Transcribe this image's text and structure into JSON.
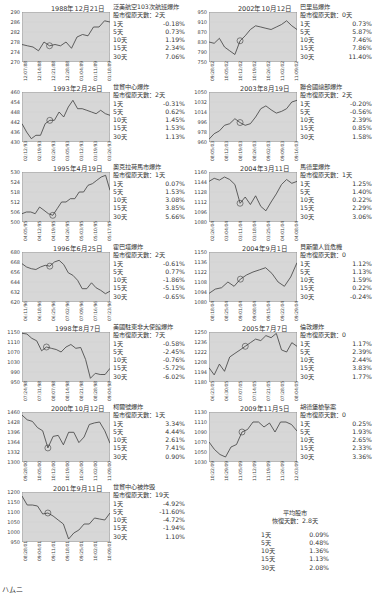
{
  "chart_data": [
    {
      "type": "line",
      "title": "1988年12月21日",
      "event": "泛美航空103次航班爆炸",
      "recovery": "股市復原天數：2天",
      "ylim": [
        270,
        290
      ],
      "yticks": [
        270,
        274,
        278,
        282,
        286,
        290
      ],
      "x": [
        "12/07/88",
        "12/14/88",
        "12/21/88",
        "12/28/88",
        "01/04/89",
        "01/11/89",
        "01/18/89"
      ],
      "values": [
        277,
        276.5,
        276,
        274.5,
        278,
        276.5,
        277,
        276.5,
        278,
        275.5,
        280,
        281,
        280.5,
        284,
        284,
        286.5,
        286
      ],
      "marker_index": 5,
      "returns": [
        {
          "p": "1天",
          "v": "-0.18%"
        },
        {
          "p": "5天",
          "v": "0.73%"
        },
        {
          "p": "10天",
          "v": "1.19%"
        },
        {
          "p": "15天",
          "v": "2.34%"
        },
        {
          "p": "30天",
          "v": "7.06%"
        }
      ]
    },
    {
      "type": "line",
      "title": "1993年2月26日",
      "event": "世貿中心爆炸",
      "recovery": "股市復原天數：2天",
      "ylim": [
        430,
        460
      ],
      "yticks": [
        430,
        436,
        442,
        448,
        454,
        460
      ],
      "x": [
        "02/12/93",
        "02/19/93",
        "02/26/93",
        "03/05/93",
        "03/12/93",
        "03/19/93",
        "03/26/93"
      ],
      "values": [
        441,
        436,
        432,
        434,
        434,
        441,
        443,
        443,
        448,
        445,
        451,
        455,
        450,
        450,
        449,
        448,
        447,
        449,
        447,
        446
      ],
      "marker_index": 6,
      "returns": [
        {
          "p": "1天",
          "v": "-0.31%"
        },
        {
          "p": "5天",
          "v": "0.62%"
        },
        {
          "p": "10天",
          "v": "1.45%"
        },
        {
          "p": "15天",
          "v": "1.53%"
        },
        {
          "p": "30天",
          "v": "1.13%"
        }
      ]
    },
    {
      "type": "line",
      "title": "1995年4月19日",
      "event": "奧克拉荷馬市爆炸",
      "recovery": "股市復原天數：1天",
      "ylim": [
        500,
        530
      ],
      "yticks": [
        500,
        506,
        512,
        518,
        524,
        530
      ],
      "x": [
        "04/05/95",
        "04/12/95",
        "04/19/95",
        "04/26/95",
        "05/03/95",
        "05/10/95",
        "05/17/95"
      ],
      "values": [
        505,
        506,
        506,
        505,
        509,
        507,
        505,
        504,
        508,
        512,
        512,
        514,
        514,
        518,
        518,
        522,
        523,
        525,
        527,
        528,
        519
      ],
      "marker_index": 7,
      "returns": [
        {
          "p": "1天",
          "v": "0.07%"
        },
        {
          "p": "5天",
          "v": "1.53%"
        },
        {
          "p": "10天",
          "v": "3.08%"
        },
        {
          "p": "15天",
          "v": "3.85%"
        },
        {
          "p": "30天",
          "v": "5.66%"
        }
      ]
    },
    {
      "type": "line",
      "title": "1996年6月25日",
      "event": "霍巴塔爆炸",
      "recovery": "股市復原天數：2天",
      "ylim": [
        620,
        680
      ],
      "yticks": [
        620,
        632,
        644,
        656,
        668,
        680
      ],
      "x": [
        "06/11/96",
        "06/18/96",
        "06/25/96",
        "07/02/96",
        "07/09/96",
        "07/16/96",
        "07/23/96"
      ],
      "values": [
        666,
        662,
        660,
        659,
        662,
        664,
        663,
        668,
        670,
        665,
        655,
        652,
        646,
        636,
        636,
        643,
        637,
        634,
        630,
        633
      ],
      "marker_index": 6,
      "returns": [
        {
          "p": "1天",
          "v": "-0.61%"
        },
        {
          "p": "5天",
          "v": "0.77%"
        },
        {
          "p": "10天",
          "v": "-1.86%"
        },
        {
          "p": "15天",
          "v": "-5.15%"
        },
        {
          "p": "30天",
          "v": "-0.65%"
        }
      ]
    },
    {
      "type": "line",
      "title": "1998年8月7日",
      "event": "美國駐東非大使館爆炸",
      "recovery": "股市復原天數：7天",
      "ylim": [
        950,
        1150
      ],
      "yticks": [
        950,
        990,
        1030,
        1070,
        1110,
        1150
      ],
      "x": [
        "07/24/98",
        "07/31/98",
        "08/07/98",
        "08/14/98",
        "08/21/98",
        "08/28/98",
        "09/04/98"
      ],
      "values": [
        1145,
        1142,
        1125,
        1115,
        1075,
        1090,
        1085,
        1080,
        1070,
        1090,
        1100,
        1085,
        1088,
        1040,
        965,
        985,
        980,
        980,
        1005
      ],
      "marker_index": 5,
      "returns": [
        {
          "p": "1天",
          "v": "-0.58%"
        },
        {
          "p": "5天",
          "v": "-2.45%"
        },
        {
          "p": "10天",
          "v": "-0.76%"
        },
        {
          "p": "15天",
          "v": "-5.72%"
        },
        {
          "p": "30天",
          "v": "-6.02%"
        }
      ]
    },
    {
      "type": "line",
      "title": "2000年10月12日",
      "event": "柯爾號爆炸",
      "recovery": "股市復原天數：1天",
      "ylim": [
        1300,
        1460
      ],
      "yticks": [
        1300,
        1332,
        1364,
        1396,
        1428,
        1460
      ],
      "x": [
        "09/28/00",
        "10/05/00",
        "10/12/00",
        "10/19/00",
        "10/26/00",
        "11/02/00",
        "11/09/00"
      ],
      "values": [
        1450,
        1435,
        1430,
        1410,
        1400,
        1345,
        1382,
        1385,
        1355,
        1395,
        1395,
        1362,
        1380,
        1420,
        1425,
        1428,
        1400,
        1360
      ],
      "marker_index": 5,
      "returns": [
        {
          "p": "1天",
          "v": "3.34%"
        },
        {
          "p": "5天",
          "v": "4.44%"
        },
        {
          "p": "10天",
          "v": "2.61%"
        },
        {
          "p": "15天",
          "v": "7.41%"
        },
        {
          "p": "30天",
          "v": "0.90%"
        }
      ]
    },
    {
      "type": "line",
      "title": "2001年9月11日",
      "event": "世貿中心被炸毀",
      "recovery": "股市復原天數：19天",
      "ylim": [
        950,
        1200
      ],
      "yticks": [
        950,
        1000,
        1050,
        1100,
        1150,
        1200
      ],
      "x": [
        "08/28/01",
        "09/04/01",
        "09/11/01",
        "09/18/01",
        "09/25/01",
        "10/02/01",
        "10/09/01"
      ],
      "values": [
        1180,
        1135,
        1135,
        1130,
        1090,
        1095,
        1080,
        1060,
        1040,
        965,
        995,
        1010,
        1040,
        1040,
        1070,
        1065,
        1060,
        1095
      ],
      "marker_index": 5,
      "returns": [
        {
          "p": "1天",
          "v": "-4.92%"
        },
        {
          "p": "5天",
          "v": "-11.60%"
        },
        {
          "p": "10天",
          "v": "-4.72%"
        },
        {
          "p": "15天",
          "v": "-1.94%"
        },
        {
          "p": "30天",
          "v": "1.10%"
        }
      ]
    },
    {
      "type": "line",
      "title": "2002年10月12日",
      "event": "巴里島爆炸",
      "recovery": "股市復原天數：0天",
      "ylim": [
        750,
        950
      ],
      "yticks": [
        750,
        790,
        830,
        870,
        910,
        950
      ],
      "x": [
        "09/28/02",
        "10/05/02",
        "10/12/02",
        "10/19/02",
        "10/26/02",
        "11/02/02",
        "11/09/02"
      ],
      "values": [
        830,
        825,
        845,
        810,
        795,
        780,
        835,
        855,
        880,
        895,
        890,
        885,
        880,
        890,
        900,
        915,
        895,
        880
      ],
      "marker_index": 6,
      "returns": [
        {
          "p": "1天",
          "v": "0.73%"
        },
        {
          "p": "5天",
          "v": "5.87%"
        },
        {
          "p": "10天",
          "v": "7.46%"
        },
        {
          "p": "15天",
          "v": "7.86%"
        },
        {
          "p": "30天",
          "v": "11.40%"
        }
      ]
    },
    {
      "type": "line",
      "title": "2003年8月19日",
      "event": "聯合國總部爆炸",
      "recovery": "股市復原天數：2天",
      "ylim": [
        960,
        1050
      ],
      "yticks": [
        960,
        978,
        996,
        1014,
        1032,
        1050
      ],
      "x": [
        "08/05/03",
        "08/12/03",
        "08/19/03",
        "08/26/03",
        "09/02/03",
        "09/09/03",
        "09/16/03"
      ],
      "values": [
        965,
        975,
        980,
        990,
        993,
        1002,
        995,
        990,
        993,
        1005,
        1020,
        1025,
        1018,
        1012,
        1015,
        1020,
        1032,
        1035
      ],
      "marker_index": 6,
      "returns": [
        {
          "p": "1天",
          "v": "-0.20%"
        },
        {
          "p": "5天",
          "v": "-0.56%"
        },
        {
          "p": "10天",
          "v": "2.39%"
        },
        {
          "p": "15天",
          "v": "0.85%"
        },
        {
          "p": "30天",
          "v": "1.58%"
        }
      ]
    },
    {
      "type": "line",
      "title": "2004年3月11日",
      "event": "馬德里爆炸",
      "recovery": "股市復原天數：1天",
      "ylim": [
        1080,
        1160
      ],
      "yticks": [
        1080,
        1096,
        1112,
        1128,
        1144,
        1160
      ],
      "x": [
        "02/26/04",
        "03/04/04",
        "03/11/04",
        "03/18/04",
        "03/25/04",
        "04/01/04",
        "04/08/04"
      ],
      "values": [
        1145,
        1150,
        1147,
        1152,
        1148,
        1140,
        1110,
        1120,
        1108,
        1122,
        1105,
        1098,
        1112,
        1125,
        1140,
        1148,
        1142,
        1145
      ],
      "marker_index": 6,
      "returns": [
        {
          "p": "1天",
          "v": "1.25%"
        },
        {
          "p": "5天",
          "v": "1.40%"
        },
        {
          "p": "10天",
          "v": "0.22%"
        },
        {
          "p": "15天",
          "v": "2.29%"
        },
        {
          "p": "30天",
          "v": "3.06%"
        }
      ]
    },
    {
      "type": "line",
      "title": "2004年9月1日",
      "event": "貝斯蘭人質危機",
      "recovery": "股市復原天數：0",
      "ylim": [
        1080,
        1150
      ],
      "yticks": [
        1080,
        1094,
        1108,
        1122,
        1136,
        1150
      ],
      "x": [
        "08/18/04",
        "08/25/04",
        "09/01/04",
        "09/08/04",
        "09/15/04",
        "09/22/04",
        "09/29/04"
      ],
      "values": [
        1092,
        1098,
        1100,
        1108,
        1102,
        1112,
        1118,
        1122,
        1125,
        1128,
        1120,
        1108,
        1102,
        1115,
        1135
      ],
      "marker_index": 5,
      "returns": [
        {
          "p": "1天",
          "v": "1.12%"
        },
        {
          "p": "5天",
          "v": "1.13%"
        },
        {
          "p": "10天",
          "v": "1.59%"
        },
        {
          "p": "15天",
          "v": "0.22%"
        },
        {
          "p": "30天",
          "v": "-0.24%"
        }
      ]
    },
    {
      "type": "line",
      "title": "2005年7月7日",
      "event": "倫敦爆炸",
      "recovery": "股市復原天數：0",
      "ylim": [
        1180,
        1250
      ],
      "yticks": [
        1180,
        1194,
        1208,
        1222,
        1236,
        1250
      ],
      "x": [
        "06/23/05",
        "06/30/05",
        "07/07/05",
        "07/14/05",
        "07/21/05",
        "07/28/05",
        "08/04/05"
      ],
      "values": [
        1200,
        1190,
        1205,
        1195,
        1215,
        1220,
        1225,
        1230,
        1235,
        1240,
        1238,
        1245,
        1242,
        1248,
        1225,
        1222,
        1235,
        1230
      ],
      "marker_index": 7,
      "returns": [
        {
          "p": "1天",
          "v": "1.17%"
        },
        {
          "p": "5天",
          "v": "2.39%"
        },
        {
          "p": "10天",
          "v": "2.44%"
        },
        {
          "p": "15天",
          "v": "3.83%"
        },
        {
          "p": "30天",
          "v": "1.77%"
        }
      ]
    },
    {
      "type": "line",
      "title": "2009年11月5日",
      "event": "胡德堡槍擊案",
      "recovery": "股市復原天數：0",
      "ylim": [
        1030,
        1130
      ],
      "yticks": [
        1030,
        1050,
        1070,
        1090,
        1110,
        1130
      ],
      "x": [
        "10/22/09",
        "10/29/09",
        "11/05/09",
        "11/12/09",
        "11/19/09",
        "11/26/09",
        "12/03/09"
      ],
      "values": [
        1070,
        1055,
        1045,
        1040,
        1060,
        1065,
        1090,
        1095,
        1110,
        1110,
        1100,
        1108,
        1090,
        1110,
        1110,
        1105,
        1092
      ],
      "marker_index": 6,
      "returns": [
        {
          "p": "1天",
          "v": "0.25%"
        },
        {
          "p": "5天",
          "v": "1.93%"
        },
        {
          "p": "10天",
          "v": "2.65%"
        },
        {
          "p": "15天",
          "v": "2.33%"
        },
        {
          "p": "30天",
          "v": "3.36%"
        }
      ]
    }
  ],
  "average": {
    "title": "平均股市",
    "recovery": "恢復天數：2.8天",
    "returns": [
      {
        "p": "1天",
        "v": "0.09%"
      },
      {
        "p": "5天",
        "v": "0.48%"
      },
      {
        "p": "10天",
        "v": "1.36%"
      },
      {
        "p": "15天",
        "v": "1.13%"
      },
      {
        "p": "30天",
        "v": "2.08%"
      }
    ]
  },
  "footer_partial": "ハムニ"
}
